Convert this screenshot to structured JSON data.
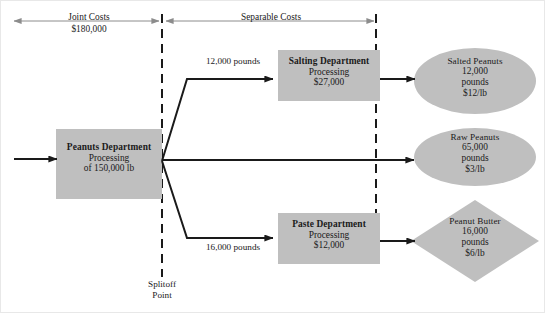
{
  "diagram": {
    "fill_color": "#bfbfbf",
    "line_color": "#1a1a1a",
    "bracket_color": "#8c8c8c",
    "brackets": [
      {
        "id": "joint-costs",
        "label": "Joint Costs",
        "value": "$180,000"
      },
      {
        "id": "separable-costs",
        "label": "Separable Costs",
        "value": ""
      }
    ],
    "splitoff": {
      "line1": "Splitoff",
      "line2": "Point"
    },
    "process_nodes": [
      {
        "id": "peanuts-department",
        "title": "Peanuts Department",
        "line2": "Processing",
        "line3": "of 150,000 lb"
      },
      {
        "id": "salting-department",
        "title": "Salting Department",
        "line2": "Processing",
        "line3": "$27,000"
      },
      {
        "id": "paste-department",
        "title": "Paste Department",
        "line2": "Processing",
        "line3": "$12,000"
      }
    ],
    "output_nodes": [
      {
        "id": "salted-peanuts",
        "shape": "ellipse",
        "title": "Salted Peanuts",
        "quantity": "12,000",
        "unit": "pounds",
        "price": "$12/lb"
      },
      {
        "id": "raw-peanuts",
        "shape": "ellipse",
        "title": "Raw Peanuts",
        "quantity": "65,000",
        "unit": "pounds",
        "price": "$3/lb"
      },
      {
        "id": "peanut-butter",
        "shape": "diamond",
        "title": "Peanut Butter",
        "quantity": "16,000",
        "unit": "pounds",
        "price": "$6/lb"
      }
    ],
    "edge_labels": [
      {
        "id": "salting-flow",
        "text": "12,000 pounds"
      },
      {
        "id": "paste-flow",
        "text": "16,000 pounds"
      }
    ]
  }
}
